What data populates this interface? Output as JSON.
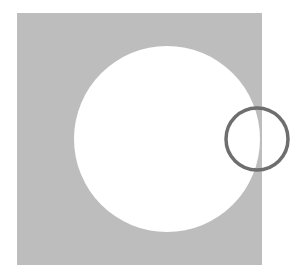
{
  "diagram": {
    "canvas": {
      "width": 306,
      "height": 280,
      "background": "#ffffff"
    },
    "square": {
      "x": 17,
      "y": 13,
      "width": 245,
      "height": 252,
      "fill": "#bdbdbd"
    },
    "large_circle": {
      "cx": 167,
      "cy": 139,
      "r": 93,
      "fill": "#ffffff"
    },
    "small_ring": {
      "cx": 257,
      "cy": 139,
      "r": 31,
      "stroke": "#6e6e6e",
      "stroke_width": 3.5
    }
  }
}
